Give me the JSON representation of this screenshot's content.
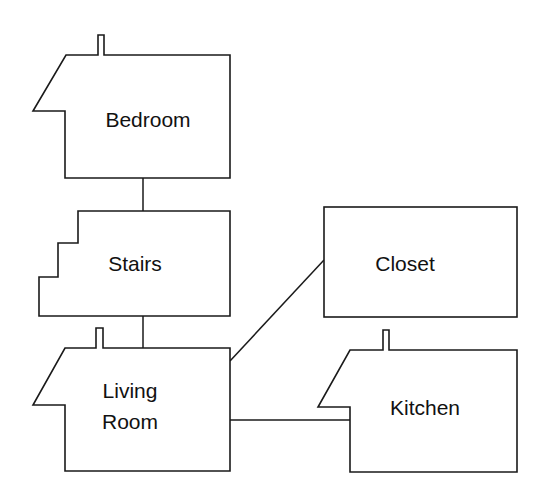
{
  "diagram": {
    "type": "room-connectivity",
    "nodes": [
      {
        "id": "bedroom",
        "label": "Bedroom",
        "shape": "house"
      },
      {
        "id": "stairs",
        "label": "Stairs",
        "shape": "stairs"
      },
      {
        "id": "closet",
        "label": "Closet",
        "shape": "rectangle"
      },
      {
        "id": "living_room",
        "label_line1": "Living",
        "label_line2": "Room",
        "shape": "house"
      },
      {
        "id": "kitchen",
        "label": "Kitchen",
        "shape": "house"
      }
    ],
    "edges": [
      {
        "from": "bedroom",
        "to": "stairs"
      },
      {
        "from": "stairs",
        "to": "living_room"
      },
      {
        "from": "living_room",
        "to": "closet"
      },
      {
        "from": "living_room",
        "to": "kitchen"
      }
    ],
    "colors": {
      "stroke": "#1a1a1a",
      "fill": "#ffffff",
      "background": "#ffffff"
    }
  }
}
